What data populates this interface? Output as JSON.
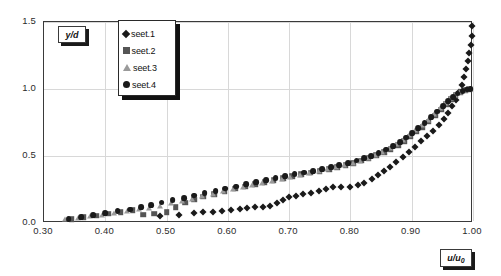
{
  "chart_data": {
    "type": "scatter",
    "title": "",
    "xlabel": "u/u0",
    "ylabel": "y/d",
    "xlim": [
      0.3,
      1.0
    ],
    "ylim": [
      0.0,
      1.5
    ],
    "xticks": [
      "0.30",
      "0.40",
      "0.50",
      "0.60",
      "0.70",
      "0.80",
      "0.90",
      "1.00"
    ],
    "yticks": [
      "0.0",
      "0.5",
      "1.0",
      "1.5"
    ],
    "grid": true,
    "legend_position": "top-left-inside",
    "series": [
      {
        "name": "seet.1",
        "marker": "diamond",
        "color": "#1a1a1a",
        "points": [
          [
            0.49,
            0.055
          ],
          [
            0.52,
            0.06
          ],
          [
            0.545,
            0.075
          ],
          [
            0.56,
            0.08
          ],
          [
            0.575,
            0.085
          ],
          [
            0.59,
            0.092
          ],
          [
            0.605,
            0.1
          ],
          [
            0.62,
            0.108
          ],
          [
            0.632,
            0.115
          ],
          [
            0.645,
            0.118
          ],
          [
            0.658,
            0.12
          ],
          [
            0.668,
            0.128
          ],
          [
            0.68,
            0.15
          ],
          [
            0.69,
            0.175
          ],
          [
            0.7,
            0.195
          ],
          [
            0.712,
            0.205
          ],
          [
            0.722,
            0.215
          ],
          [
            0.735,
            0.225
          ],
          [
            0.748,
            0.24
          ],
          [
            0.76,
            0.255
          ],
          [
            0.772,
            0.268
          ],
          [
            0.785,
            0.27
          ],
          [
            0.8,
            0.272
          ],
          [
            0.812,
            0.285
          ],
          [
            0.822,
            0.3
          ],
          [
            0.835,
            0.33
          ],
          [
            0.845,
            0.36
          ],
          [
            0.855,
            0.39
          ],
          [
            0.865,
            0.42
          ],
          [
            0.875,
            0.455
          ],
          [
            0.885,
            0.49
          ],
          [
            0.895,
            0.53
          ],
          [
            0.905,
            0.57
          ],
          [
            0.915,
            0.61
          ],
          [
            0.925,
            0.65
          ],
          [
            0.935,
            0.69
          ],
          [
            0.945,
            0.735
          ],
          [
            0.952,
            0.775
          ],
          [
            0.96,
            0.82
          ],
          [
            0.966,
            0.87
          ],
          [
            0.972,
            0.92
          ],
          [
            0.977,
            0.975
          ],
          [
            0.982,
            1.03
          ],
          [
            0.986,
            1.09
          ],
          [
            0.989,
            1.15
          ],
          [
            0.992,
            1.21
          ],
          [
            0.994,
            1.27
          ],
          [
            0.996,
            1.33
          ],
          [
            0.998,
            1.395
          ],
          [
            0.999,
            1.47
          ]
        ]
      },
      {
        "name": "seet.2",
        "marker": "square",
        "color": "#555555",
        "points": [
          [
            0.345,
            0.03
          ],
          [
            0.365,
            0.042
          ],
          [
            0.385,
            0.055
          ],
          [
            0.405,
            0.068
          ],
          [
            0.425,
            0.082
          ],
          [
            0.445,
            0.095
          ],
          [
            0.462,
            0.062
          ],
          [
            0.48,
            0.07
          ],
          [
            0.5,
            0.082
          ],
          [
            0.515,
            0.12
          ],
          [
            0.53,
            0.15
          ],
          [
            0.545,
            0.175
          ],
          [
            0.56,
            0.195
          ],
          [
            0.578,
            0.215
          ],
          [
            0.595,
            0.235
          ],
          [
            0.612,
            0.255
          ],
          [
            0.628,
            0.272
          ],
          [
            0.645,
            0.29
          ],
          [
            0.66,
            0.305
          ],
          [
            0.675,
            0.32
          ],
          [
            0.69,
            0.335
          ],
          [
            0.705,
            0.35
          ],
          [
            0.72,
            0.362
          ],
          [
            0.735,
            0.375
          ],
          [
            0.75,
            0.388
          ],
          [
            0.765,
            0.402
          ],
          [
            0.778,
            0.418
          ],
          [
            0.792,
            0.432
          ],
          [
            0.805,
            0.448
          ],
          [
            0.818,
            0.465
          ],
          [
            0.83,
            0.485
          ],
          [
            0.842,
            0.505
          ],
          [
            0.855,
            0.528
          ],
          [
            0.866,
            0.552
          ],
          [
            0.878,
            0.58
          ],
          [
            0.888,
            0.61
          ],
          [
            0.898,
            0.645
          ],
          [
            0.908,
            0.68
          ],
          [
            0.918,
            0.715
          ],
          [
            0.928,
            0.755
          ],
          [
            0.938,
            0.8
          ],
          [
            0.948,
            0.845
          ],
          [
            0.956,
            0.888
          ],
          [
            0.964,
            0.925
          ],
          [
            0.972,
            0.952
          ],
          [
            0.98,
            0.975
          ],
          [
            0.988,
            0.99
          ],
          [
            0.994,
            1.0
          ]
        ]
      },
      {
        "name": "seet.3",
        "marker": "triangle",
        "color": "#9a9a9a",
        "points": [
          [
            0.335,
            0.028
          ],
          [
            0.355,
            0.038
          ],
          [
            0.375,
            0.05
          ],
          [
            0.395,
            0.062
          ],
          [
            0.415,
            0.075
          ],
          [
            0.435,
            0.088
          ],
          [
            0.455,
            0.102
          ],
          [
            0.472,
            0.115
          ],
          [
            0.49,
            0.13
          ],
          [
            0.508,
            0.148
          ],
          [
            0.525,
            0.165
          ],
          [
            0.542,
            0.182
          ],
          [
            0.558,
            0.2
          ],
          [
            0.575,
            0.218
          ],
          [
            0.592,
            0.236
          ],
          [
            0.608,
            0.252
          ],
          [
            0.625,
            0.268
          ],
          [
            0.64,
            0.285
          ],
          [
            0.656,
            0.3
          ],
          [
            0.672,
            0.315
          ],
          [
            0.688,
            0.33
          ],
          [
            0.702,
            0.345
          ],
          [
            0.718,
            0.358
          ],
          [
            0.732,
            0.372
          ],
          [
            0.748,
            0.386
          ],
          [
            0.762,
            0.4
          ],
          [
            0.776,
            0.415
          ],
          [
            0.79,
            0.43
          ],
          [
            0.804,
            0.448
          ],
          [
            0.816,
            0.466
          ],
          [
            0.828,
            0.486
          ],
          [
            0.84,
            0.508
          ],
          [
            0.852,
            0.532
          ],
          [
            0.864,
            0.558
          ],
          [
            0.875,
            0.588
          ],
          [
            0.886,
            0.62
          ],
          [
            0.896,
            0.655
          ],
          [
            0.906,
            0.692
          ],
          [
            0.916,
            0.73
          ],
          [
            0.926,
            0.772
          ],
          [
            0.936,
            0.815
          ],
          [
            0.946,
            0.858
          ],
          [
            0.955,
            0.898
          ],
          [
            0.963,
            0.93
          ],
          [
            0.971,
            0.955
          ],
          [
            0.979,
            0.975
          ],
          [
            0.987,
            0.99
          ],
          [
            0.993,
            0.998
          ]
        ]
      },
      {
        "name": "seet.4",
        "marker": "circle",
        "color": "#1a1a1a",
        "points": [
          [
            0.34,
            0.032
          ],
          [
            0.36,
            0.045
          ],
          [
            0.38,
            0.058
          ],
          [
            0.4,
            0.072
          ],
          [
            0.42,
            0.086
          ],
          [
            0.44,
            0.1
          ],
          [
            0.458,
            0.118
          ],
          [
            0.475,
            0.135
          ],
          [
            0.492,
            0.152
          ],
          [
            0.51,
            0.17
          ],
          [
            0.528,
            0.188
          ],
          [
            0.545,
            0.205
          ],
          [
            0.562,
            0.222
          ],
          [
            0.58,
            0.24
          ],
          [
            0.596,
            0.256
          ],
          [
            0.613,
            0.272
          ],
          [
            0.63,
            0.288
          ],
          [
            0.646,
            0.303
          ],
          [
            0.662,
            0.318
          ],
          [
            0.678,
            0.333
          ],
          [
            0.694,
            0.348
          ],
          [
            0.709,
            0.362
          ],
          [
            0.724,
            0.376
          ],
          [
            0.739,
            0.39
          ],
          [
            0.754,
            0.404
          ],
          [
            0.768,
            0.418
          ],
          [
            0.782,
            0.433
          ],
          [
            0.796,
            0.448
          ],
          [
            0.81,
            0.465
          ],
          [
            0.822,
            0.483
          ],
          [
            0.834,
            0.502
          ],
          [
            0.846,
            0.524
          ],
          [
            0.858,
            0.548
          ],
          [
            0.87,
            0.575
          ],
          [
            0.881,
            0.605
          ],
          [
            0.891,
            0.638
          ],
          [
            0.901,
            0.672
          ],
          [
            0.911,
            0.708
          ],
          [
            0.921,
            0.748
          ],
          [
            0.931,
            0.79
          ],
          [
            0.941,
            0.832
          ],
          [
            0.951,
            0.875
          ],
          [
            0.959,
            0.912
          ],
          [
            0.967,
            0.942
          ],
          [
            0.975,
            0.965
          ],
          [
            0.983,
            0.982
          ],
          [
            0.99,
            0.995
          ],
          [
            0.996,
            1.002
          ]
        ]
      }
    ]
  }
}
